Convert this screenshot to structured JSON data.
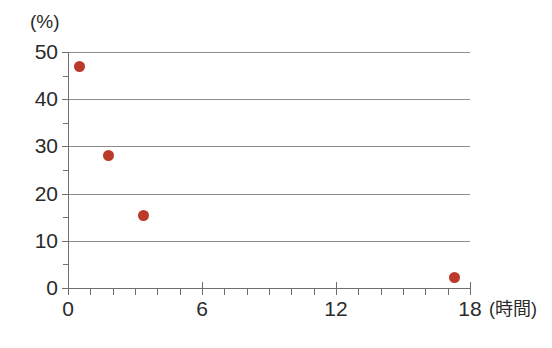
{
  "chart_data": {
    "type": "scatter",
    "title": "",
    "subtitle": "",
    "xlabel": "(時間)",
    "ylabel": "(%)",
    "xlim": [
      0,
      18
    ],
    "ylim": [
      0,
      50
    ],
    "grid": true,
    "legend": false,
    "legend_position": "none",
    "point_color": "#bc3a2a",
    "gridline_color": "#8d8d8d",
    "axis_color": "#6f6f6f",
    "background_color": "#ffffff",
    "x_major_ticks": [
      0,
      6,
      12,
      18
    ],
    "x_minor_tick_step": 1,
    "x_tick_labels": [
      "0",
      "6",
      "12",
      "18"
    ],
    "y_major_ticks": [
      0,
      10,
      20,
      30,
      40,
      50
    ],
    "y_minor_ticks": [
      5,
      15,
      25,
      35,
      45
    ],
    "y_tick_labels": [
      "50",
      "40",
      "30",
      "20",
      "10",
      "0"
    ],
    "gridline_values": [
      10,
      20,
      30,
      40,
      50
    ],
    "series": [
      {
        "name": "",
        "marker": "circle",
        "points": [
          {
            "x": 0.5,
            "y": 47.0
          },
          {
            "x": 1.8,
            "y": 28.0
          },
          {
            "x": 3.4,
            "y": 15.3
          },
          {
            "x": 17.3,
            "y": 2.3
          }
        ]
      }
    ]
  }
}
